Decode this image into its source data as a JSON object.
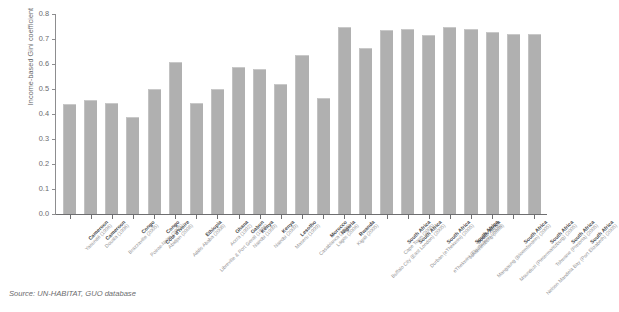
{
  "chart_data": {
    "type": "bar",
    "title": "",
    "xlabel": "",
    "ylabel": "Income-based Gini coefficient",
    "ylim": [
      0.0,
      0.8
    ],
    "ytick_labels": [
      "0.0",
      "0.1",
      "0.2",
      "0.3",
      "0.4",
      "0.5",
      "0.6",
      "0.7",
      "0.8"
    ],
    "ytick_values": [
      0.0,
      0.1,
      0.2,
      0.3,
      0.4,
      0.5,
      0.6,
      0.7,
      0.8
    ],
    "grid": false,
    "legend": "none",
    "bar_color": "#b0b0b0",
    "axis_color": "#6e6e70",
    "categories": [
      "Cameroon (Yaoundé 1996)",
      "Cameroon (Douala 1996)",
      "Congo (Brazzaville 2005)",
      "Congo (Pointe-Noire 2005)",
      "Côte d'Ivoire (Abidjan 2008)",
      "Ethiopia (Addis Ababa 2008)",
      "Gabon (Libreville & Port Gentil 1996)",
      "Ghana (Accra 1992)",
      "Kenya (Nairobi 1999)",
      "Kenya (Nairobi 2009)",
      "Lesotho (Maseru 1999)",
      "Morocco (Casablanca 2006)",
      "Nigeria (Lagos 2006)",
      "Rwanda (Kigali 2005)",
      "South Africa (Buffalo City East London 2005)",
      "South Africa (Cape Town 2005)",
      "South Africa (Durban eThekwini 2005)",
      "South Africa (Ekurhuleni Ekurhuleni 2005)",
      "South Africa (Johannesburg 2005)",
      "South Africa (Mangaung Bloemfontein 2005)",
      "South Africa (Msunduzi Pietermaritzburg 2005)",
      "South Africa (Nelson Mandela Bay Port Elizabeth 2005)",
      "South Africa (Tshwane Pretoria 2005)"
    ],
    "country_labels": [
      "Cameroon",
      "Cameroon",
      "Congo",
      "Congo",
      "Côte d'Ivoire",
      "Ethiopia",
      "Gabon",
      "Ghana",
      "Kenya",
      "Kenya",
      "Lesotho",
      "Morocco",
      "Nigeria",
      "Rwanda",
      "South Africa",
      "South Africa",
      "South Africa",
      "South Africa",
      "South Africa",
      "South Africa",
      "South Africa",
      "South Africa",
      "South Africa"
    ],
    "city_labels": [
      "Yaoundé (1996)",
      "Douala (1996)",
      "Brazzaville (2005)",
      "Pointe-Noire (2005)",
      "Abidjan (2008)",
      "Addis Ababa (2008)",
      "Libreville & Port Gentil (1996)",
      "Accra (1992)",
      "Nairobi (1999)",
      "Nairobi (2009)",
      "Maseru (1999)",
      "Casablanca (2006)",
      "Lagos (2006)",
      "Kigali (2005)",
      "Buffalo City (East London) (2005)",
      "Cape Town (2005)",
      "Durban (eThekwini) (2005)",
      "eThekwini (Ekurhuleni) (2005)",
      "Johannesburg (2005)",
      "Mangaung (Bloemfontein) (2005)",
      "Msunduzi (Pietermaritzburg) (2005)",
      "Nelson Mandela Bay (Port Elizabeth) (2005)",
      "Tshwane (Pretoria) (2005)"
    ],
    "values": [
      0.44,
      0.455,
      0.445,
      0.39,
      0.5,
      0.61,
      0.445,
      0.5,
      0.59,
      0.58,
      0.52,
      0.635,
      0.465,
      0.75,
      0.665,
      0.735,
      0.74,
      0.715,
      0.75,
      0.74,
      0.73,
      0.72,
      0.72
    ]
  },
  "source": {
    "text": "Source: UN-HABITAT, GUO database"
  }
}
